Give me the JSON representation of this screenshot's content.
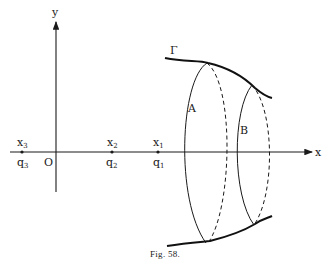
{
  "figure": {
    "caption": "Fig. 58.",
    "axes": {
      "x_label": "x",
      "y_label": "y",
      "origin_label": "O"
    },
    "points": [
      {
        "name": "x",
        "sub": "1",
        "q_name": "q",
        "q_sub": "1"
      },
      {
        "name": "x",
        "sub": "2",
        "q_name": "q",
        "q_sub": "2"
      },
      {
        "name": "x",
        "sub": "3",
        "q_name": "q",
        "q_sub": "3"
      }
    ],
    "curve_label": "Γ",
    "surfaces": [
      {
        "label": "A"
      },
      {
        "label": "B"
      }
    ]
  }
}
